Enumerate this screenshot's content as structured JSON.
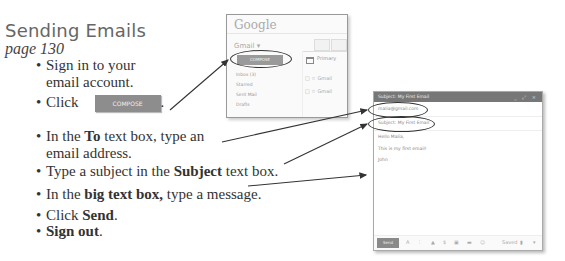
{
  "header": {
    "title": "Sending Emails",
    "page_ref": "page 130"
  },
  "steps": [
    {
      "line1": "Sign in to your",
      "line2": "email account."
    },
    {
      "prefix": "Click",
      "button": "COMPOSE",
      "suffix": "."
    },
    {
      "pre": "In the ",
      "bold": "To",
      "post": " text box, type an",
      "line2": "email address."
    },
    {
      "pre": "Type a subject in the ",
      "bold": "Subject",
      "post": " text box."
    },
    {
      "pre": "In the ",
      "bold": "big text box,",
      "post": " type a message."
    },
    {
      "pre": "Click ",
      "bold": "Send",
      "post": "."
    },
    {
      "bold": "Sign out",
      "post": "."
    }
  ],
  "gmail": {
    "logo": "Google",
    "label": "Gmail ▾",
    "compose": "COMPOSE",
    "folders": [
      "Inbox (3)",
      "Starred",
      "Sent Mail",
      "Drafts"
    ],
    "primary_tab": "Primary",
    "rows": [
      "Gmail",
      "Gmail"
    ]
  },
  "compose_window": {
    "title": "Subject: My First Email",
    "controls": "_ ⤢ ×",
    "to": "malia@gmail.com",
    "subject": "Subject: My First Email",
    "body": [
      "Hello Malia,",
      "This is my first email!",
      "John"
    ],
    "send": "Send",
    "saved": "Saved"
  }
}
